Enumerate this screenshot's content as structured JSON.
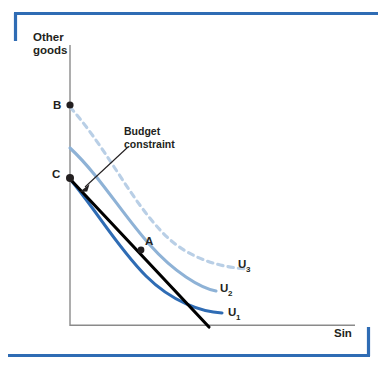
{
  "figure": {
    "title_axes": {
      "y_axis_label_line1": "Other",
      "y_axis_label_line2": "goods",
      "x_axis_label": "Sin"
    },
    "callout": {
      "line1": "Budget",
      "line2": "constraint"
    },
    "points": [
      {
        "id": "B",
        "label": "B",
        "x": 70,
        "y": 105
      },
      {
        "id": "C",
        "label": "C",
        "x": 70,
        "y": 178
      },
      {
        "id": "A",
        "label": "A",
        "x": 141,
        "y": 250
      }
    ],
    "curves": [
      {
        "id": "U3",
        "label": "U",
        "subscript": "3",
        "style": "dashed",
        "color": "#b9cfe6"
      },
      {
        "id": "U2",
        "label": "U",
        "subscript": "2",
        "style": "solid",
        "color": "#8eb2d6"
      },
      {
        "id": "U1",
        "label": "U",
        "subscript": "1",
        "style": "solid",
        "color": "#2f6cb4"
      }
    ],
    "budget_line": {
      "label": "Budget constraint",
      "color": "#000000"
    },
    "colors": {
      "frame": "#2f6cb4",
      "axis": "#8a8a8a",
      "text": "#231f20",
      "u1": "#2f6cb4",
      "u2": "#8eb2d6",
      "u3": "#b9cfe6",
      "budget": "#000000",
      "background": "#ffffff"
    }
  }
}
